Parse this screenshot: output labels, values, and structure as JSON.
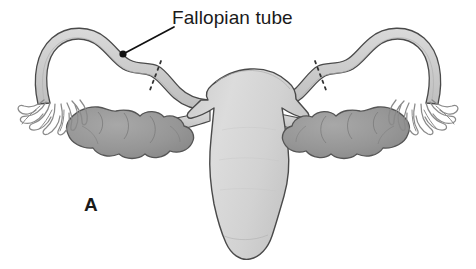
{
  "figure": {
    "panel_letter": "A",
    "background_color": "#ffffff",
    "width": 476,
    "height": 269
  },
  "labels": {
    "fallopian_tube": "Fallopian tube"
  },
  "colors": {
    "outline": "#4a4a4a",
    "uterus_fill": "#d4d4d4",
    "tube_fill": "#cfcfcf",
    "ovary_fill": "#9a9a9a",
    "ovary_outline": "#555555",
    "fimbriae": "#8e8e8e",
    "text": "#1a1a1a",
    "leader_line": "#111111",
    "cut_mark": "#333333"
  },
  "structures": [
    {
      "name": "uterus-body",
      "label": "Uterus"
    },
    {
      "name": "cervix",
      "label": "Cervix"
    },
    {
      "name": "left-fallopian-tube",
      "label": "Fallopian tube"
    },
    {
      "name": "right-fallopian-tube",
      "label": "Fallopian tube"
    },
    {
      "name": "left-ovary",
      "label": "Ovary"
    },
    {
      "name": "right-ovary",
      "label": "Ovary"
    },
    {
      "name": "left-fimbriae",
      "label": "Fimbriae"
    },
    {
      "name": "right-fimbriae",
      "label": "Fimbriae"
    },
    {
      "name": "left-ovarian-ligament",
      "label": "Ovarian ligament"
    },
    {
      "name": "right-ovarian-ligament",
      "label": "Ovarian ligament"
    },
    {
      "name": "left-cut-mark",
      "label": "Cut mark"
    },
    {
      "name": "right-cut-mark",
      "label": "Cut mark"
    }
  ]
}
